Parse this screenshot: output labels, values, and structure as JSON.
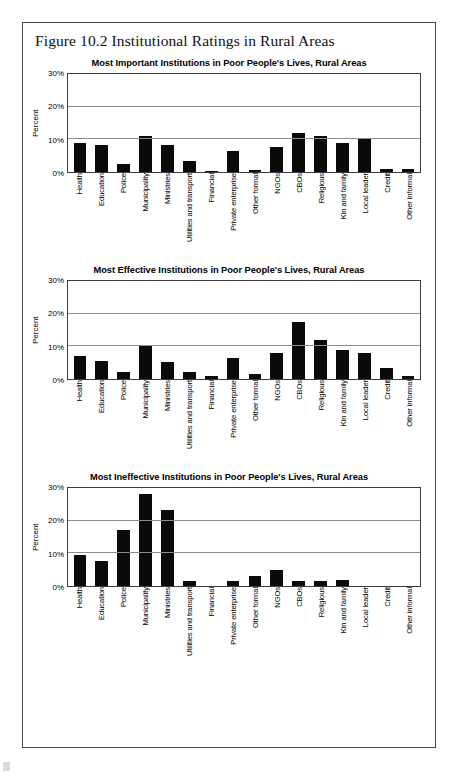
{
  "figure": {
    "title": "Figure 10.2 Institutional Ratings in Rural Areas"
  },
  "axis": {
    "ylabel": "Percent",
    "yticks": [
      "0%",
      "10%",
      "20%",
      "30%"
    ]
  },
  "chart_data": [
    {
      "type": "bar",
      "title": "Most Important Institutions in Poor People's Lives, Rural Areas",
      "xlabel": "",
      "ylabel": "Percent",
      "ylim": [
        0,
        30
      ],
      "yticks": [
        0,
        10,
        20,
        30
      ],
      "grid": true,
      "legend": "none",
      "categories": [
        "Health",
        "Education",
        "Police",
        "Municipality",
        "Ministries",
        "Utilities and transport",
        "Financial",
        "Private enterprise",
        "Other formal",
        "NGOs",
        "CBOs",
        "Religious",
        "Kin and family",
        "Local leader",
        "Credit",
        "Other informal"
      ],
      "values": [
        9.0,
        8.4,
        2.5,
        11.0,
        8.3,
        3.5,
        0.4,
        6.4,
        0.5,
        7.6,
        12.0,
        11.1,
        8.8,
        10.2,
        1.0,
        1.0
      ]
    },
    {
      "type": "bar",
      "title": "Most Effective Institutions in Poor People's Lives, Rural Areas",
      "xlabel": "",
      "ylabel": "Percent",
      "ylim": [
        0,
        30
      ],
      "yticks": [
        0,
        10,
        20,
        30
      ],
      "grid": true,
      "legend": "none",
      "categories": [
        "Health",
        "Education",
        "Police",
        "Municipality",
        "Ministries",
        "Utilities and transport",
        "Financial",
        "Private enterprise",
        "Other formal",
        "NGOs",
        "CBOs",
        "Religious",
        "Kin and family",
        "Local leader",
        "Credit",
        "Other informal"
      ],
      "values": [
        7.0,
        5.5,
        2.2,
        10.0,
        5.3,
        2.0,
        0.8,
        6.5,
        1.6,
        8.0,
        17.5,
        12.0,
        8.8,
        8.1,
        3.5,
        1.0
      ]
    },
    {
      "type": "bar",
      "title": "Most Ineffective Institutions in Poor People's Lives, Rural Areas",
      "xlabel": "",
      "ylabel": "Percent",
      "ylim": [
        0,
        30
      ],
      "yticks": [
        0,
        10,
        20,
        30
      ],
      "grid": true,
      "legend": "none",
      "categories": [
        "Health",
        "Education",
        "Police",
        "Municipality",
        "Ministries",
        "Utilities and transport",
        "Financial",
        "Private enterprise",
        "Other formal",
        "NGOs",
        "CBOs",
        "Religious",
        "Kin and family",
        "Local leader",
        "Credit",
        "Other informal"
      ],
      "values": [
        9.5,
        7.8,
        17.2,
        28.3,
        23.4,
        1.5,
        0.0,
        1.5,
        3.0,
        4.9,
        1.5,
        1.5,
        1.7,
        0.0,
        0.0,
        0.0
      ]
    }
  ],
  "colors": {
    "bar": "#0a0a0a",
    "grid": "#8c8c8c",
    "frame": "#3d3d3d",
    "page_border": "#4a4a4a",
    "text": "#111111"
  }
}
